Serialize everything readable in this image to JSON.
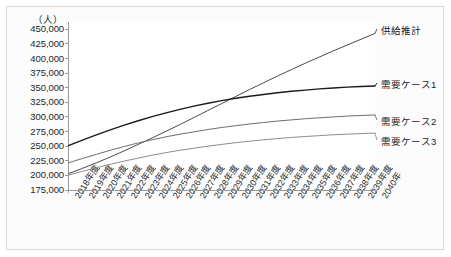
{
  "chart_data": {
    "type": "line",
    "title": "",
    "subtitle": "",
    "xlabel": "",
    "ylabel": "",
    "unit_label": "（人）",
    "grid": false,
    "legend_position": "right-inline-labels",
    "ylim": [
      175000,
      462500
    ],
    "yticks": [
      175000,
      200000,
      225000,
      250000,
      275000,
      300000,
      325000,
      350000,
      375000,
      400000,
      425000,
      450000
    ],
    "ytick_labels": [
      "175,000",
      "200,000",
      "225,000",
      "250,000",
      "275,000",
      "300,000",
      "325,000",
      "350,000",
      "375,000",
      "400,000",
      "425,000",
      "450,000"
    ],
    "categories": [
      "2018年度",
      "2019年度",
      "2020年度",
      "2021年度",
      "2022年度",
      "2023年度",
      "2024年度",
      "2025年度",
      "2026年度",
      "2027年度",
      "2028年度",
      "2029年度",
      "2030年度",
      "2031年度",
      "2032年度",
      "2033年度",
      "2034年度",
      "2035年度",
      "2036年度",
      "2037年度",
      "2038年度",
      "2039年度",
      "2040年"
    ],
    "series": [
      {
        "name": "供給推計",
        "color": "#4a4a4a",
        "width": 1.0,
        "values": [
          203000,
          212000,
          221500,
          231500,
          242000,
          253000,
          264000,
          275500,
          287000,
          299000,
          311000,
          323000,
          335000,
          347000,
          358500,
          370000,
          381000,
          392000,
          402500,
          413000,
          423000,
          433000,
          443000
        ]
      },
      {
        "name": "需要ケース1",
        "color": "#1a1a1a",
        "width": 1.4,
        "values": [
          251000,
          260500,
          269500,
          278000,
          286000,
          293500,
          300500,
          307000,
          313000,
          318500,
          323500,
          328000,
          332000,
          335500,
          338500,
          341500,
          344000,
          346000,
          348000,
          349500,
          351000,
          352000,
          353000
        ]
      },
      {
        "name": "需要ケース2",
        "color": "#6e6e6e",
        "width": 1.0,
        "values": [
          221500,
          229000,
          236000,
          243000,
          249500,
          255500,
          261000,
          266000,
          270500,
          274500,
          278500,
          282000,
          285000,
          288000,
          290500,
          293000,
          295000,
          297000,
          298500,
          300000,
          301500,
          302500,
          303500
        ]
      },
      {
        "name": "需要ケース3",
        "color": "#8c8c8c",
        "width": 1.0,
        "values": [
          200500,
          207000,
          213000,
          219000,
          224500,
          229500,
          234500,
          239000,
          243000,
          246500,
          250000,
          253000,
          256000,
          258500,
          261000,
          263000,
          265000,
          266500,
          268000,
          269500,
          270500,
          271500,
          272500
        ]
      }
    ],
    "series_label_positions": [
      {
        "name": "供給推計",
        "x": 381,
        "y": 29
      },
      {
        "name": "需要ケース1",
        "x": 381,
        "y": 83
      },
      {
        "name": "需要ケース2",
        "x": 381,
        "y": 120
      },
      {
        "name": "需要ケース3",
        "x": 381,
        "y": 140
      }
    ],
    "axis_color": "#9a9a9a",
    "frame_color": "#d8d8d8",
    "background": "#ffffff"
  }
}
